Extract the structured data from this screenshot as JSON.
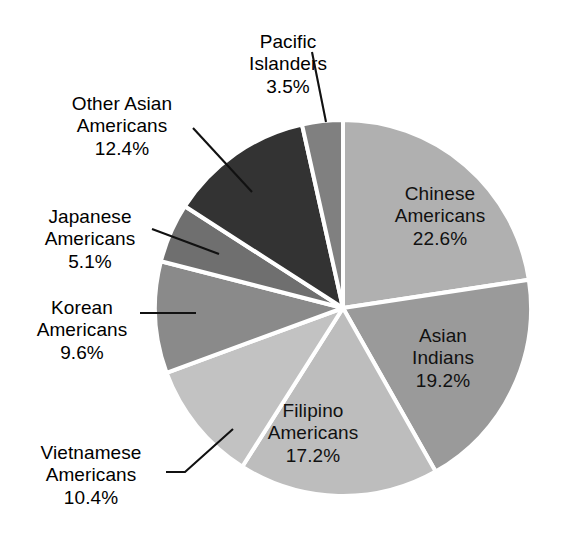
{
  "chart_data": {
    "type": "pie",
    "title": "",
    "categories": [
      "Chinese Americans",
      "Asian Indians",
      "Filipino Americans",
      "Vietnamese Americans",
      "Korean Americans",
      "Japanese Americans",
      "Other Asian Americans",
      "Pacific Islanders"
    ],
    "values": [
      22.6,
      19.2,
      17.2,
      10.4,
      9.6,
      5.1,
      12.4,
      3.5
    ],
    "value_labels": [
      "22.6%",
      "19.2%",
      "17.2%",
      "10.4%",
      "9.6%",
      "5.1%",
      "12.4%",
      "3.5%"
    ],
    "unit": "%",
    "start_angle_deg": 0,
    "direction": "clockwise",
    "legend": "none",
    "colors": [
      "#b0b0b0",
      "#9a9a9a",
      "#bdbdbd",
      "#c2c2c2",
      "#8a8a8a",
      "#6f6f6f",
      "#333333",
      "#808080"
    ],
    "slice_separator_color": "#ffffff"
  },
  "slices": [
    {
      "name": "Chinese Americans",
      "label_line1": "Chinese",
      "label_line2": "Americans",
      "percent": "22.6%",
      "value": 22.6,
      "color": "#b0b0b0",
      "label_placement": "inside",
      "has_leader_line": false
    },
    {
      "name": "Asian Indians",
      "label_line1": "Asian",
      "label_line2": "Indians",
      "percent": "19.2%",
      "value": 19.2,
      "color": "#9a9a9a",
      "label_placement": "inside",
      "has_leader_line": false
    },
    {
      "name": "Filipino Americans",
      "label_line1": "Filipino",
      "label_line2": "Americans",
      "percent": "17.2%",
      "value": 17.2,
      "color": "#bdbdbd",
      "label_placement": "inside",
      "has_leader_line": false
    },
    {
      "name": "Vietnamese Americans",
      "label_line1": "Vietnamese",
      "label_line2": "Americans",
      "percent": "10.4%",
      "value": 10.4,
      "color": "#c2c2c2",
      "label_placement": "outside",
      "has_leader_line": true
    },
    {
      "name": "Korean Americans",
      "label_line1": "Korean",
      "label_line2": "Americans",
      "percent": "9.6%",
      "value": 9.6,
      "color": "#8a8a8a",
      "label_placement": "outside",
      "has_leader_line": true
    },
    {
      "name": "Japanese Americans",
      "label_line1": "Japanese",
      "label_line2": "Americans",
      "percent": "5.1%",
      "value": 5.1,
      "color": "#6f6f6f",
      "label_placement": "outside",
      "has_leader_line": true
    },
    {
      "name": "Other Asian Americans",
      "label_line1": "Other Asian",
      "label_line2": "Americans",
      "percent": "12.4%",
      "value": 12.4,
      "color": "#333333",
      "label_placement": "outside",
      "has_leader_line": true
    },
    {
      "name": "Pacific Islanders",
      "label_line1": "Pacific",
      "label_line2": "Islanders",
      "percent": "3.5%",
      "value": 3.5,
      "color": "#808080",
      "label_placement": "outside",
      "has_leader_line": true
    }
  ]
}
